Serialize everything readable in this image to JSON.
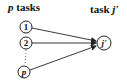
{
  "header": {
    "left_var": "p",
    "left_text": " tasks",
    "right_text": "task ",
    "right_var": "j'"
  },
  "nodes": [
    {
      "id": "1",
      "label": "1",
      "cx": 26,
      "cy": 27
    },
    {
      "id": "2",
      "label": "2",
      "cx": 26,
      "cy": 43
    },
    {
      "id": "p",
      "label": "p",
      "cx": 24,
      "cy": 72
    },
    {
      "id": "j",
      "label": "j'",
      "cx": 104,
      "cy": 43
    }
  ],
  "edges": [
    {
      "from": "1",
      "to": "j'"
    },
    {
      "from": "2",
      "to": "j'"
    },
    {
      "from": "p",
      "to": "j'"
    }
  ],
  "colors": {
    "stroke": "#222222",
    "text": "#111111",
    "background": "#ffffff"
  }
}
